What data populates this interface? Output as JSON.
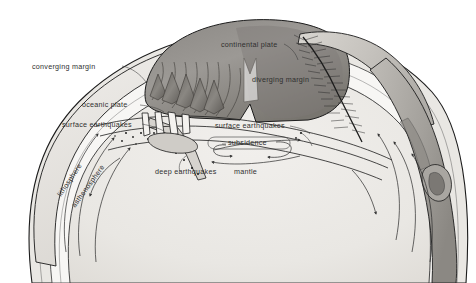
{
  "figure": {
    "background_color": "#ffffff",
    "ink_color": "#2f2f2f"
  },
  "palette": {
    "paper": "#ffffff",
    "mantle_fill": "#eceae6",
    "asthenosphere_fill": "#f7f6f4",
    "lithosphere_fill": "#e4e1dc",
    "crust_light": "#e9e7e3",
    "continent_dark": "#8d8a86",
    "continent_mid": "#a5a29d",
    "mountain_shadow": "#6e6b67",
    "outline": "#1c1c1c",
    "label_text": "#2f2f2f"
  },
  "labels": [
    {
      "id": "converging-margin",
      "text": "converging margin",
      "x": 32,
      "y": 63,
      "rotation": 0
    },
    {
      "id": "oceanic-plate",
      "text": "oceanic plate",
      "x": 82,
      "y": 101,
      "rotation": 0
    },
    {
      "id": "surface-earthquakes-left",
      "text": "surface earthquakes",
      "x": 62,
      "y": 121,
      "rotation": 0
    },
    {
      "id": "continental-plate",
      "text": "continental plate",
      "x": 221,
      "y": 41,
      "rotation": 0
    },
    {
      "id": "diverging-margin",
      "text": "diverging margin",
      "x": 252,
      "y": 76,
      "rotation": 0
    },
    {
      "id": "surface-earthquakes-right",
      "text": "surface earthquakes",
      "x": 215,
      "y": 122,
      "rotation": 0
    },
    {
      "id": "subsidence",
      "text": "subsidence",
      "x": 228,
      "y": 139,
      "rotation": 0
    },
    {
      "id": "deep-earthquakes",
      "text": "deep earthquakes",
      "x": 155,
      "y": 168,
      "rotation": 0
    },
    {
      "id": "mantle",
      "text": "mantle",
      "x": 234,
      "y": 168,
      "rotation": 0
    },
    {
      "id": "lithosphere",
      "text": "lithosphere",
      "x": 59,
      "y": 192,
      "rotation": -56
    },
    {
      "id": "asthenosphere",
      "text": "asthenosphere",
      "x": 73,
      "y": 203,
      "rotation": -54
    }
  ],
  "label_text": {
    "converging_margin": "converging margin",
    "oceanic_plate": "oceanic plate",
    "surface_earthquakes_left": "surface earthquakes",
    "continental_plate": "continental plate",
    "diverging_margin": "diverging margin",
    "surface_earthquakes_right": "surface earthquakes",
    "subsidence": "subsidence",
    "deep_earthquakes": "deep earthquakes",
    "mantle": "mantle",
    "lithosphere": "lithosphere",
    "asthenosphere": "asthenosphere"
  },
  "features": {
    "mountain_range": "folded mountain belt at converging margin",
    "mid_ocean_ridge": "spreading ridge with transverse fracture hatching at diverging margin",
    "subduction_zone": "descending slab with deep earthquake foci",
    "trench": "oceanic trench at right margin",
    "convection_arrows": "mantle convection flow arrows within asthenosphere"
  }
}
